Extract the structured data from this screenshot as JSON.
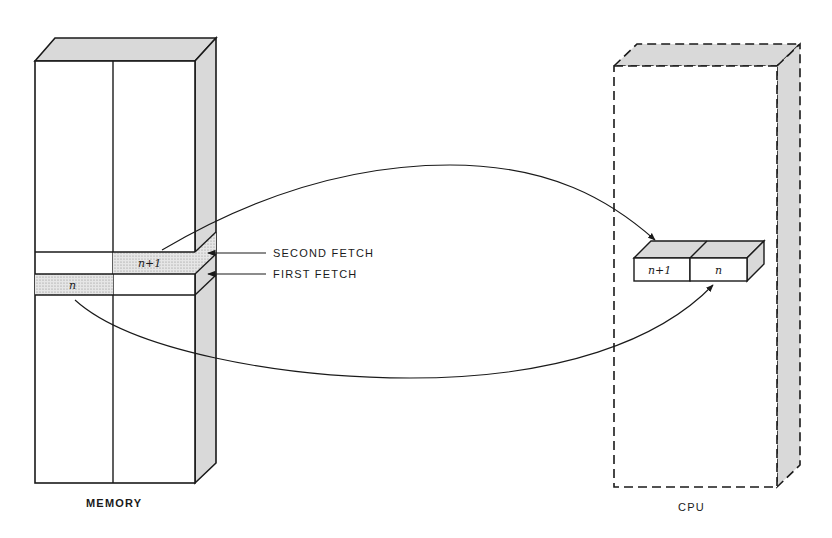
{
  "diagram": {
    "memory": {
      "label": "MEMORY",
      "cell_upper": "n+1",
      "cell_lower": "n"
    },
    "cpu": {
      "label": "CPU",
      "register_left": "n+1",
      "register_right": "n"
    },
    "annotations": {
      "second_fetch": "SECOND FETCH",
      "first_fetch": "FIRST FETCH"
    },
    "colors": {
      "line": "#1a1a1a",
      "shade": "#d9d9d9",
      "stipple": "#cfcfcf"
    }
  }
}
